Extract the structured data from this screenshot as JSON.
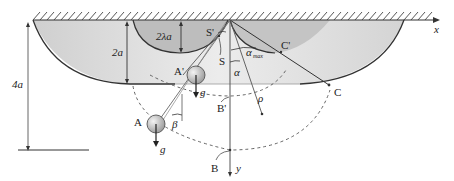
{
  "diagram": {
    "labels": {
      "x_axis": "x",
      "y_axis": "y",
      "height_4a": "4a",
      "height_2a": "2a",
      "height_2lambda_a": "2λa",
      "point_S_prime": "S'",
      "point_S": "S",
      "point_A": "A",
      "point_A_prime": "A'",
      "point_B": "B",
      "point_B_prime": "B'",
      "point_C": "C",
      "point_C_prime": "C'",
      "angle_alpha": "α",
      "angle_alpha_max": "α",
      "angle_alpha_max_sub": "max",
      "angle_beta": "β",
      "radius_rho": "ρ",
      "gravity_A": "g",
      "gravity_A_prime": "g"
    },
    "colors": {
      "line": "#333333",
      "fill_outer": "#d9d9d9",
      "fill_inner": "#bfbfbf",
      "ball": "#c8c8c8",
      "hatch": "#444444"
    }
  }
}
